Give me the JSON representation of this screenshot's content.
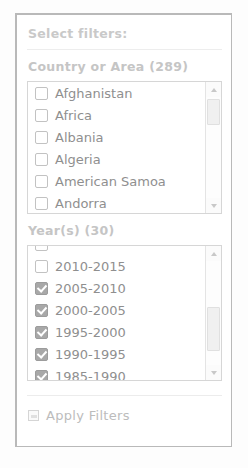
{
  "panel": {
    "header": "Select filters:",
    "apply_button": {
      "label": "Apply Filters",
      "icon": "checkbox-small-icon"
    }
  },
  "country_section": {
    "label": "Country or Area (289)",
    "items": [
      {
        "label": "Afghanistan",
        "checked": false
      },
      {
        "label": "Africa",
        "checked": false
      },
      {
        "label": "Albania",
        "checked": false
      },
      {
        "label": "Algeria",
        "checked": false
      },
      {
        "label": "American Samoa",
        "checked": false
      },
      {
        "label": "Andorra",
        "checked": false
      }
    ],
    "scrollbar": {
      "up_arrow": "scroll-up-arrow-icon",
      "down_arrow": "scroll-down-arrow-icon"
    }
  },
  "year_section": {
    "label": "Year(s) (30)",
    "items": [
      {
        "label": "",
        "checked": false
      },
      {
        "label": "2010-2015",
        "checked": false
      },
      {
        "label": "2005-2010",
        "checked": true
      },
      {
        "label": "2000-2005",
        "checked": true
      },
      {
        "label": "1995-2000",
        "checked": true
      },
      {
        "label": "1990-1995",
        "checked": true
      },
      {
        "label": "1985-1990",
        "checked": true
      }
    ],
    "scrollbar": {
      "up_arrow": "scroll-up-arrow-icon",
      "down_arrow": "scroll-down-arrow-icon"
    }
  },
  "colors": {
    "panel_border": "#b9b9b9",
    "label_text": "#c5c5c5",
    "item_text": "#8f8f8f",
    "checkbox_checked_fill": "#a8a8a8",
    "checkbox_border": "#c2c2c2",
    "background": "#fdfdfd"
  }
}
